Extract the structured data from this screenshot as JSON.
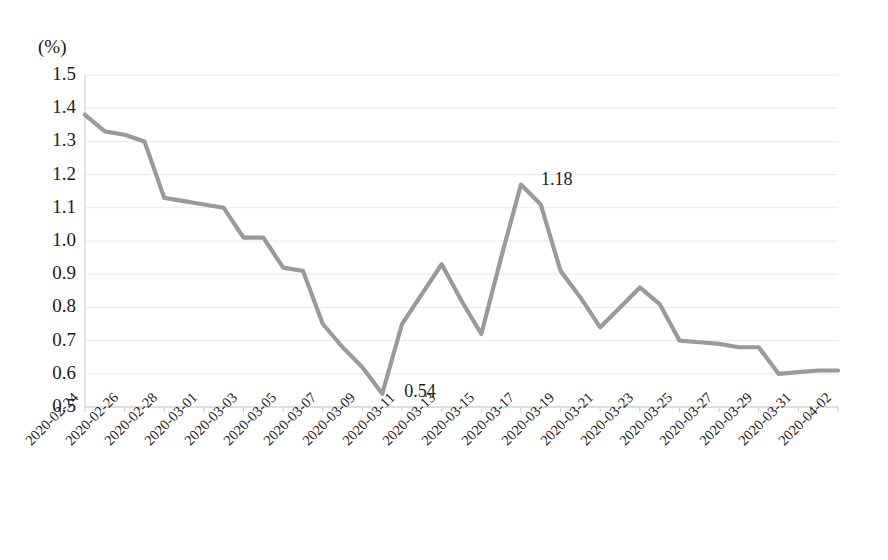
{
  "chart_data": {
    "type": "line",
    "title": "",
    "xlabel": "",
    "ylabel": "(%)",
    "unit_label": "(%)",
    "ylim": [
      0.5,
      1.5
    ],
    "ytick_values": [
      "1.5",
      "1.4",
      "1.3",
      "1.2",
      "1.1",
      "1.0",
      "0.9",
      "0.8",
      "0.7",
      "0.6",
      "0.5"
    ],
    "grid": true,
    "legend": "none",
    "line_color": "#9a9a9a",
    "x": [
      "2020-02-24",
      "2020-02-25",
      "2020-02-26",
      "2020-02-27",
      "2020-02-28",
      "2020-02-29",
      "2020-03-01",
      "2020-03-02",
      "2020-03-03",
      "2020-03-04",
      "2020-03-05",
      "2020-03-06",
      "2020-03-07",
      "2020-03-08",
      "2020-03-09",
      "2020-03-10",
      "2020-03-11",
      "2020-03-12",
      "2020-03-13",
      "2020-03-14",
      "2020-03-15",
      "2020-03-16",
      "2020-03-17",
      "2020-03-18",
      "2020-03-19",
      "2020-03-20",
      "2020-03-21",
      "2020-03-22",
      "2020-03-23",
      "2020-03-24",
      "2020-03-25",
      "2020-03-26",
      "2020-03-27",
      "2020-03-28",
      "2020-03-29",
      "2020-03-30",
      "2020-03-31",
      "2020-04-01",
      "2020-04-02"
    ],
    "xtick_labels": [
      "2020-02-24",
      "2020-02-26",
      "2020-02-28",
      "2020-03-01",
      "2020-03-03",
      "2020-03-05",
      "2020-03-07",
      "2020-03-09",
      "2020-03-11",
      "2020-03-13",
      "2020-03-15",
      "2020-03-17",
      "2020-03-19",
      "2020-03-21",
      "2020-03-23",
      "2020-03-25",
      "2020-03-27",
      "2020-03-29",
      "2020-03-31",
      "2020-04-02"
    ],
    "values": [
      1.38,
      1.33,
      1.32,
      1.3,
      1.13,
      1.12,
      1.11,
      1.1,
      1.01,
      1.01,
      0.92,
      0.91,
      0.75,
      0.68,
      0.62,
      0.54,
      0.75,
      0.84,
      0.93,
      0.82,
      0.72,
      0.95,
      1.17,
      1.11,
      0.91,
      0.83,
      0.74,
      0.8,
      0.86,
      0.81,
      0.7,
      0.695,
      0.69,
      0.68,
      0.68,
      0.6,
      0.605,
      0.61,
      0.61
    ],
    "annotations": [
      {
        "text": "0.54",
        "value": 0.54,
        "date": "2020-03-10"
      },
      {
        "text": "1.18",
        "value": 1.18,
        "date": "2020-03-17"
      }
    ]
  }
}
